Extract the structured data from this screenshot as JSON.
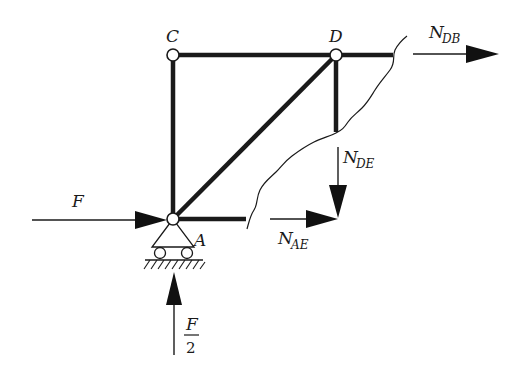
{
  "diagram": {
    "type": "truss-free-body",
    "nodes": {
      "C": "C",
      "D": "D",
      "A": "A"
    },
    "forces": {
      "applied": {
        "label": "F",
        "direction": "right",
        "at": "A"
      },
      "reaction": {
        "numerator": "F",
        "denominator": "2",
        "direction": "up",
        "at": "A"
      },
      "N_DB": {
        "base": "N",
        "sub": "DB",
        "direction": "right"
      },
      "N_DE": {
        "base": "N",
        "sub": "DE",
        "direction": "down"
      },
      "N_AE": {
        "base": "N",
        "sub": "AE",
        "direction": "right"
      }
    },
    "members": [
      "CA",
      "CD",
      "AD",
      "DE-cut",
      "DB-cut",
      "AE-cut"
    ],
    "support": {
      "type": "roller",
      "at": "A"
    },
    "section_cut": "jagged"
  }
}
